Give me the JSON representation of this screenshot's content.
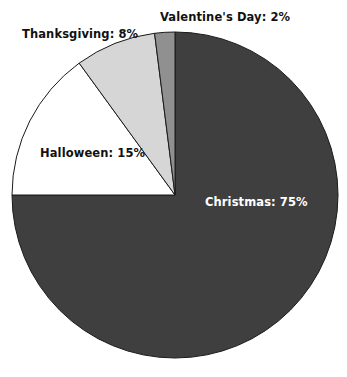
{
  "chart_data": {
    "type": "pie",
    "title": "",
    "subtitle": "",
    "xlabel": "",
    "ylabel": "",
    "legend_position": "none",
    "grid": false,
    "labels_on_slices": true,
    "start_angle_deg": 0,
    "direction": "clockwise",
    "categories": [
      "Christmas",
      "Halloween",
      "Thanksgiving",
      "Valentine's Day"
    ],
    "values": [
      75,
      15,
      8,
      2
    ],
    "unit": "%",
    "slices": [
      {
        "name": "Christmas",
        "value": 75,
        "label": "Christmas: 75%",
        "color": "#3f3f3f",
        "label_color": "#ffffff",
        "start_deg": 0,
        "end_deg": 270
      },
      {
        "name": "Halloween",
        "value": 15,
        "label": "Halloween: 15%",
        "color": "#ffffff",
        "label_color": "#111111",
        "start_deg": 270,
        "end_deg": 324
      },
      {
        "name": "Thanksgiving",
        "value": 8,
        "label": "Thanksgiving: 8%",
        "color": "#d6d6d6",
        "label_color": "#111111",
        "start_deg": 324,
        "end_deg": 352.8
      },
      {
        "name": "Valentine's Day",
        "value": 2,
        "label": "Valentine's Day: 2%",
        "color": "#909090",
        "label_color": "#111111",
        "start_deg": 352.8,
        "end_deg": 360
      }
    ],
    "geometry": {
      "center_x": 175,
      "center_y": 195,
      "radius": 163
    },
    "outline_color": "#1a1a1a",
    "background_color": "#ffffff"
  }
}
